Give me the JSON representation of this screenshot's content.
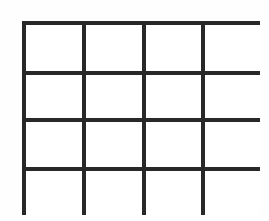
{
  "figure": {
    "kind": "blank-grid",
    "title": "",
    "caption": "",
    "rows": 4,
    "columns": 4,
    "total_cells": 16,
    "cells": [
      {
        "row": 1,
        "column": 1,
        "text": ""
      },
      {
        "row": 1,
        "column": 2,
        "text": ""
      },
      {
        "row": 1,
        "column": 3,
        "text": ""
      },
      {
        "row": 1,
        "column": 4,
        "text": ""
      },
      {
        "row": 2,
        "column": 1,
        "text": ""
      },
      {
        "row": 2,
        "column": 2,
        "text": ""
      },
      {
        "row": 2,
        "column": 3,
        "text": ""
      },
      {
        "row": 2,
        "column": 4,
        "text": ""
      },
      {
        "row": 3,
        "column": 1,
        "text": ""
      },
      {
        "row": 3,
        "column": 2,
        "text": ""
      },
      {
        "row": 3,
        "column": 3,
        "text": ""
      },
      {
        "row": 3,
        "column": 4,
        "text": ""
      },
      {
        "row": 4,
        "column": 1,
        "text": ""
      },
      {
        "row": 4,
        "column": 2,
        "text": ""
      },
      {
        "row": 4,
        "column": 3,
        "text": ""
      },
      {
        "row": 4,
        "column": 4,
        "text": ""
      }
    ]
  },
  "geometry": {
    "canvas_width_px": 269,
    "canvas_height_px": 221,
    "frame_left_px": 22,
    "frame_top_px": 21,
    "frame_width_px": 238,
    "frame_height_px": 194,
    "line_width_px": 4,
    "column_widths_px": [
      56,
      56,
      55,
      55
    ],
    "row_heights_px": [
      46,
      43,
      45,
      44
    ]
  },
  "colors": {
    "line": "#2b2b2b",
    "cell_fill": "#ffffff",
    "page_background": "#fefefe"
  }
}
